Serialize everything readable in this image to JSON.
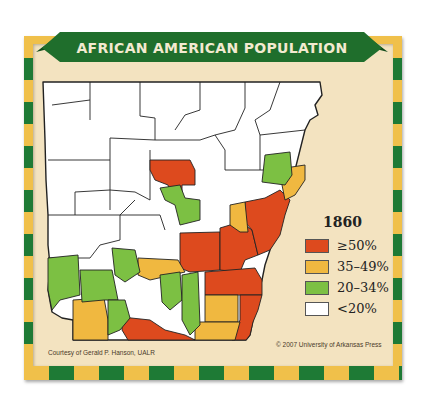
{
  "title": "AFRICAN AMERICAN POPULATION",
  "legend": {
    "year": "1860",
    "items": [
      {
        "label": "≥50%",
        "color": "#dd4a1e"
      },
      {
        "label": "35–49%",
        "color": "#f0b840"
      },
      {
        "label": "20–34%",
        "color": "#7cc043"
      },
      {
        "label": "<20%",
        "color": "#ffffff"
      }
    ]
  },
  "credits": {
    "left": "Courtesy of Gerald P. Hanson, UALR",
    "right": "© 2007 University of Arkansas Press"
  },
  "colors": {
    "banner_green": "#1f6e2c",
    "frame_yellow": "#f0c04a",
    "frame_green": "#1e7a35",
    "parchment": "#f3e3c0"
  }
}
